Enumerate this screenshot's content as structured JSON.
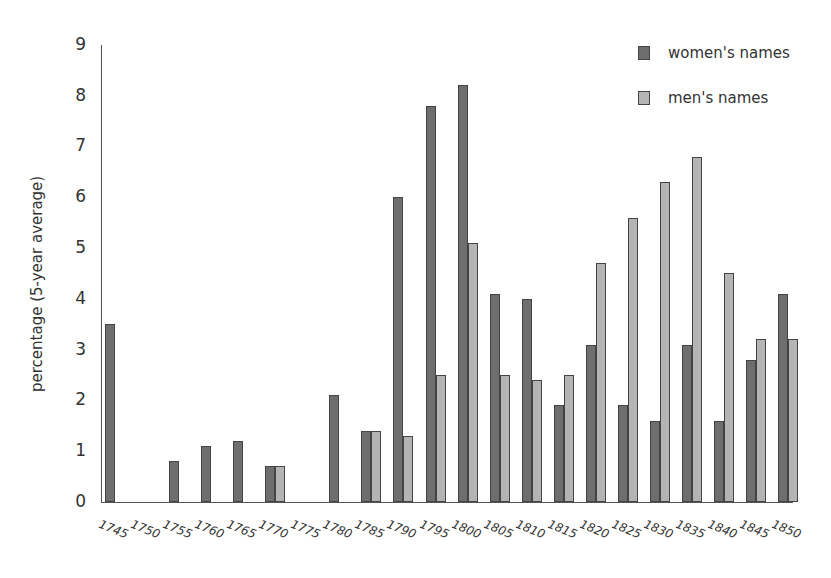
{
  "chart_data": {
    "type": "bar",
    "title": "",
    "xlabel": "",
    "ylabel": "percentage (5-year average)",
    "ylim": [
      0,
      9
    ],
    "yticks": [
      0,
      1,
      2,
      3,
      4,
      5,
      6,
      7,
      8,
      9
    ],
    "grid": false,
    "legend_position": "upper right",
    "categories": [
      "1745",
      "1750",
      "1755",
      "1760",
      "1765",
      "1770",
      "1775",
      "1780",
      "1785",
      "1790",
      "1795",
      "1800",
      "1805",
      "1810",
      "1815",
      "1820",
      "1825",
      "1830",
      "1835",
      "1840",
      "1845",
      "1850"
    ],
    "series": [
      {
        "name": "women's names",
        "color": "#6e6e6e",
        "values": [
          3.5,
          0,
          0.8,
          1.1,
          1.2,
          0.7,
          0,
          2.1,
          1.4,
          6.0,
          7.8,
          8.2,
          4.1,
          4.0,
          1.9,
          3.1,
          1.9,
          1.6,
          3.1,
          1.6,
          2.8,
          4.1
        ]
      },
      {
        "name": "men's names",
        "color": "#b4b4b4",
        "values": [
          0,
          0,
          0,
          0,
          0,
          0.7,
          0,
          0,
          1.4,
          1.3,
          2.5,
          5.1,
          2.5,
          2.4,
          2.5,
          4.7,
          5.6,
          6.3,
          6.8,
          4.5,
          3.2,
          3.2
        ]
      }
    ]
  },
  "legend": {
    "items": [
      {
        "label": "women's names"
      },
      {
        "label": "men's names"
      }
    ]
  },
  "axis": {
    "ylabel": "percentage (5-year average)"
  }
}
